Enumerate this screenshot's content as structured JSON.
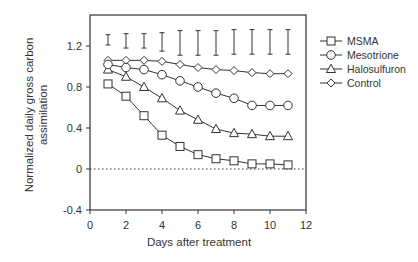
{
  "chart_data": {
    "type": "line",
    "title": "",
    "xlabel": "Days after treatment",
    "ylabel": [
      "Normalized daily gross carbon",
      "assimilation"
    ],
    "xlim": [
      0,
      12
    ],
    "ylim": [
      -0.4,
      1.4
    ],
    "x_ticks": [
      0,
      2,
      4,
      6,
      8,
      10,
      12
    ],
    "y_ticks": [
      -0.4,
      0,
      0.4,
      0.8,
      1.2
    ],
    "y_tick_labels": [
      "-0.4",
      "0",
      "0.4",
      "0.8",
      "1.2"
    ],
    "grid": false,
    "reference_line": {
      "y": 0,
      "style": "dotted"
    },
    "legend_position": "right-top, outside plot",
    "x": [
      1,
      2,
      3,
      4,
      5,
      6,
      7,
      8,
      9,
      10,
      11
    ],
    "series": [
      {
        "name": "MSMA",
        "marker": "square",
        "values": [
          0.83,
          0.71,
          0.52,
          0.33,
          0.22,
          0.14,
          0.1,
          0.08,
          0.05,
          0.05,
          0.04
        ]
      },
      {
        "name": "Mesotrione",
        "marker": "circle",
        "values": [
          1.02,
          0.99,
          0.97,
          0.92,
          0.86,
          0.8,
          0.74,
          0.69,
          0.62,
          0.62,
          0.62
        ]
      },
      {
        "name": "Halosulfuron",
        "marker": "triangle",
        "values": [
          0.97,
          0.9,
          0.8,
          0.69,
          0.57,
          0.48,
          0.39,
          0.35,
          0.34,
          0.32,
          0.32
        ]
      },
      {
        "name": "Control",
        "marker": "diamond",
        "values": [
          1.06,
          1.06,
          1.06,
          1.05,
          1.02,
          0.99,
          0.97,
          0.96,
          0.94,
          0.93,
          0.93
        ]
      }
    ],
    "error_bars": {
      "description": "LSD-style bars drawn above data",
      "center": [
        1.26,
        1.25,
        1.25,
        1.24,
        1.23,
        1.23,
        1.23,
        1.24,
        1.24,
        1.24,
        1.24
      ],
      "half_width": [
        0.05,
        0.07,
        0.07,
        0.09,
        0.12,
        0.12,
        0.12,
        0.12,
        0.12,
        0.12,
        0.12
      ]
    }
  },
  "colors": {
    "line": "#333333",
    "marker_fill": "#ffffff",
    "background": "#ffffff"
  }
}
